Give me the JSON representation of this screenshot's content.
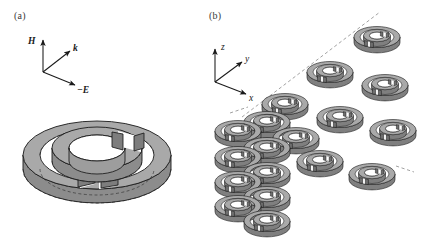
{
  "figure": {
    "type": "scientific-diagram",
    "background_color": "#ffffff"
  },
  "panels": [
    {
      "id": "a",
      "label": "(a)",
      "caption_position": "top-left",
      "content": "single double split-ring resonator unit cell with incident field triad",
      "axes": [
        {
          "name": "H",
          "label": "H",
          "bold": true,
          "italic": true,
          "direction": "up",
          "dx": 0,
          "dy": -34
        },
        {
          "name": "k",
          "label": "k",
          "bold": true,
          "italic": true,
          "direction": "up-right",
          "dx": 30,
          "dy": -22
        },
        {
          "name": "-E",
          "label": "−E",
          "bold": true,
          "italic": true,
          "direction": "right-down",
          "dx": 34,
          "dy": 13
        }
      ],
      "rings": [
        {
          "name": "outer-ring",
          "gap_clock_position": 6,
          "radius_outer": 74,
          "radius_inner": 57
        },
        {
          "name": "inner-ring",
          "gap_clock_position": 1,
          "radius_outer": 45,
          "radius_inner": 28
        }
      ]
    },
    {
      "id": "b",
      "label": "(b)",
      "caption_position": "top-left",
      "content": "three-dimensional periodic lattice array of split-ring resonators",
      "axes": [
        {
          "name": "z",
          "label": "z",
          "bold": false,
          "italic": true,
          "direction": "up",
          "dx": 0,
          "dy": -30
        },
        {
          "name": "y",
          "label": "y",
          "bold": false,
          "italic": true,
          "direction": "up-right",
          "dx": 27,
          "dy": -20
        },
        {
          "name": "x",
          "label": "x",
          "bold": false,
          "italic": true,
          "direction": "right-down",
          "dx": 31,
          "dy": 12
        }
      ],
      "lattice": {
        "rows_z": 5,
        "cols_x": 4,
        "depth_y": 3,
        "ring_count_visible": 18,
        "dashed_guide_lines": [
          "z-axis-vertical",
          "y-axis-diagonal",
          "x-axis-diagonal"
        ]
      }
    }
  ],
  "colors": {
    "ring_top_face": "#a9a9a9",
    "ring_side_face": "#8c8c8c",
    "ring_dark_face": "#787878",
    "outline": "#1a1a1a",
    "hidden_line": "#2a2a2a",
    "hole_fill": "#ffffff",
    "axis_line": "#1a1a1a",
    "guide_dash": "#8a8a8a",
    "label_text": "#3a3a3a"
  }
}
